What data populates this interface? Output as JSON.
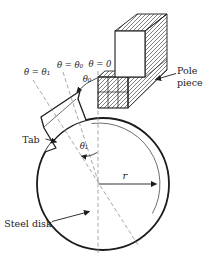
{
  "figure": {
    "labels": {
      "theta_eq_theta1": "θ = θ₁",
      "theta_eq_theta0": "θ = θ₀",
      "theta_eq_zero": "θ = 0",
      "theta0": "θ₀",
      "theta1": "θ₁",
      "r": "r",
      "tab": "Tab",
      "steel_disk": "Steel disk",
      "pole_line1": "Pole",
      "pole_line2": "piece"
    },
    "colors": {
      "ink": "#1c1c1c",
      "dashed_line": "#8f8f8f",
      "thin_line": "#4a4a4a",
      "background": "#ffffff"
    }
  }
}
